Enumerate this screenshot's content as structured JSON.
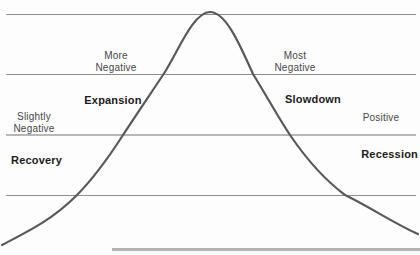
{
  "diagram": {
    "type": "economic-cycle-bell-curve",
    "curve_path": "M 2 245 C 27 232 52 220 76 196 C 92 180 107 160 123 135 C 136 115 149 96 163 75 C 178 52 193 12 210 12 C 226 12 240 45 253 74 C 266 95 278 117 290 135 C 305 157 325 180 345 195 C 370 207 395 224 418 234",
    "labels": {
      "more_negative": "More Negative",
      "most_negative": "Most Negative",
      "slightly_negative": "Slightly Negative",
      "positive": "Positive",
      "expansion": "Expansion",
      "slowdown": "Slowdown",
      "recovery": "Recovery",
      "recession": "Recession"
    }
  },
  "colors": {
    "background": "#fdfdfd",
    "curve": "#595959",
    "line": "#8e8e8e",
    "line-light": "#b7b7b7",
    "baseline": "#b3b3b3",
    "label-text": "#474747",
    "phase-text": "#1b1b1b"
  }
}
